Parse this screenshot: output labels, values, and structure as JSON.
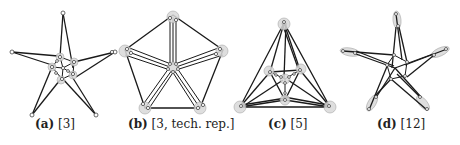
{
  "figure": {
    "subfigures": [
      {
        "label": "(a)",
        "ref": "[3]"
      },
      {
        "label": "(b)",
        "ref": "[3, tech. rep.]"
      },
      {
        "label": "(c)",
        "ref": "[5]"
      },
      {
        "label": "(d)",
        "ref": "[12]"
      }
    ]
  },
  "colors": {
    "edge": "#1a1a1a",
    "node_fill": "#ffffff",
    "halo_fill": "#d9d9d9"
  }
}
